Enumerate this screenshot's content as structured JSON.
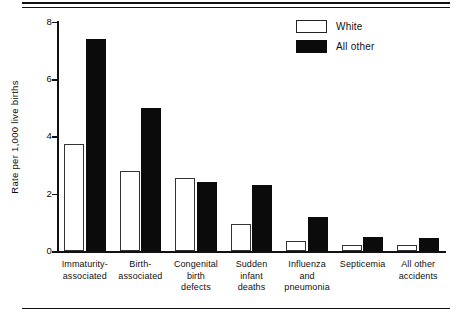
{
  "chart_data": {
    "type": "bar",
    "title": "",
    "xlabel": "",
    "ylabel": "Rate per 1,000 live births",
    "ylim": [
      0,
      8
    ],
    "yticks": [
      0,
      2,
      4,
      6,
      8
    ],
    "ytick_labels": [
      "0",
      "2",
      "4",
      "6",
      "8"
    ],
    "grid": false,
    "legend_position": "top-right",
    "categories": [
      "Immaturity-associated",
      "Birth-associated",
      "Congenital birth defects",
      "Sudden infant deaths",
      "Influenza and pneumonia",
      "Septicemia",
      "All other accidents"
    ],
    "category_lines": [
      [
        "Immaturity-",
        "associated"
      ],
      [
        "Birth-",
        "associated"
      ],
      [
        "Congenital",
        "birth",
        "defects"
      ],
      [
        "Sudden",
        "infant",
        "deaths"
      ],
      [
        "Influenza",
        "and",
        "pneumonia"
      ],
      [
        "Septicemia"
      ],
      [
        "All other",
        "accidents"
      ]
    ],
    "series": [
      {
        "name": "White",
        "color": "#ffffff",
        "values": [
          3.75,
          2.8,
          2.55,
          0.95,
          0.35,
          0.2,
          0.2
        ]
      },
      {
        "name": "All other",
        "color": "#0b0b0b",
        "values": [
          7.4,
          5.0,
          2.4,
          2.3,
          1.2,
          0.5,
          0.45
        ]
      }
    ]
  },
  "legend": {
    "items": [
      {
        "label": "White",
        "swatch": "white"
      },
      {
        "label": "All other",
        "swatch": "black"
      }
    ]
  }
}
